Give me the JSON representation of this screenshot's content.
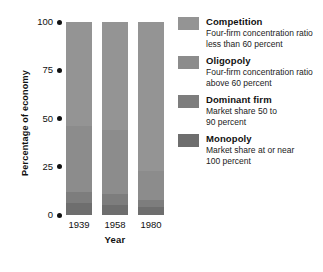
{
  "chart_data": {
    "type": "bar",
    "stacked": true,
    "title": "",
    "xlabel": "Year",
    "ylabel": "Percentage of economy",
    "categories": [
      "1939",
      "1958",
      "1980"
    ],
    "ylim": [
      0,
      100
    ],
    "yticks": [
      0,
      25,
      50,
      75,
      100
    ],
    "ytick_labels": [
      "0",
      "25",
      "50",
      "75",
      "100"
    ],
    "grid": false,
    "legend_position": "right",
    "series": [
      {
        "name": "Monopoly",
        "description_line1": "Market share at or near",
        "description_line2": "100 percent",
        "color": "#6e6e6e",
        "values": [
          6,
          5,
          4
        ]
      },
      {
        "name": "Dominant firm",
        "description_line1": "Market share 50 to",
        "description_line2": "90 percent",
        "color": "#7d7d7d",
        "values": [
          6,
          6,
          4
        ]
      },
      {
        "name": "Oligopoly",
        "description_line1": "Four-firm concentration ratio",
        "description_line2": "above 60 percent",
        "color": "#8c8c8c",
        "values": [
          34,
          33,
          15
        ]
      },
      {
        "name": "Competition",
        "description_line1": "Four-firm concentration ratio",
        "description_line2": "less than 60 percent",
        "color": "#949494",
        "values": [
          54,
          56,
          77
        ]
      }
    ]
  },
  "legend": {
    "entries": [
      {
        "label": "Competition",
        "line1": "Four-firm concentration ratio",
        "line2": "less than 60 percent",
        "color": "#949494"
      },
      {
        "label": "Oligopoly",
        "line1": "Four-firm concentration ratio",
        "line2": "above 60 percent",
        "color": "#8c8c8c"
      },
      {
        "label": "Dominant firm",
        "line1": "Market share 50 to",
        "line2": "90 percent",
        "color": "#7d7d7d"
      },
      {
        "label": "Monopoly",
        "line1": "Market share at or near",
        "line2": "100 percent",
        "color": "#6e6e6e"
      }
    ]
  }
}
